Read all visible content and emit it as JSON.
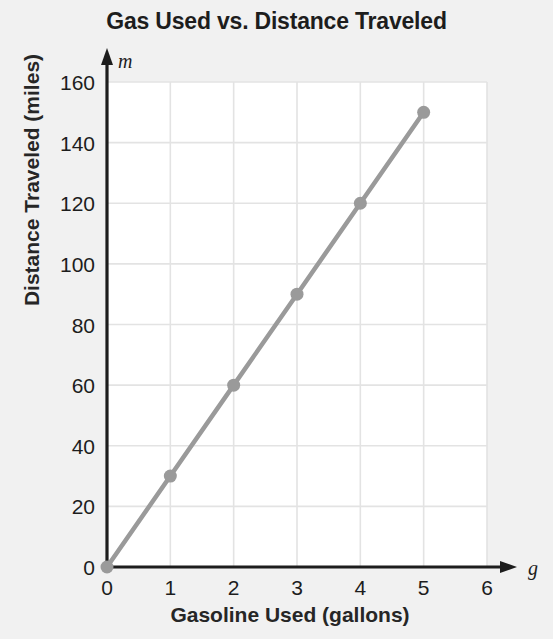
{
  "chart_data": {
    "type": "line",
    "title": "Gas Used vs. Distance Traveled",
    "xlabel": "Gasoline Used (gallons)",
    "ylabel": "Distance Traveled (miles)",
    "x_axis_variable": "g",
    "y_axis_variable": "m",
    "x": [
      0,
      1,
      2,
      3,
      4,
      5
    ],
    "values": [
      0,
      30,
      60,
      90,
      120,
      150
    ],
    "series": [
      {
        "name": "Distance Traveled",
        "x": [
          0,
          1,
          2,
          3,
          4,
          5
        ],
        "values": [
          0,
          30,
          60,
          90,
          120,
          150
        ]
      }
    ],
    "xlim": [
      0,
      6
    ],
    "ylim": [
      0,
      160
    ],
    "x_ticks": [
      0,
      1,
      2,
      3,
      4,
      5,
      6
    ],
    "x_tick_labels": [
      "0",
      "1",
      "2",
      "3",
      "4",
      "5",
      "6"
    ],
    "y_ticks": [
      0,
      20,
      40,
      60,
      80,
      100,
      120,
      140,
      160
    ],
    "y_tick_labels": [
      "0",
      "20",
      "40",
      "60",
      "80",
      "100",
      "120",
      "140",
      "160"
    ],
    "grid": true,
    "legend": "none",
    "slope": 30,
    "markers": "circle",
    "colors": {
      "line": "#9a9a9a",
      "marker": "#9a9a9a",
      "axis": "#1d1d1d",
      "grid": "#e3e3e3",
      "plot_background": "#ffffff",
      "page_background": "#f1f1f1",
      "text": "#1d1d1d"
    }
  }
}
